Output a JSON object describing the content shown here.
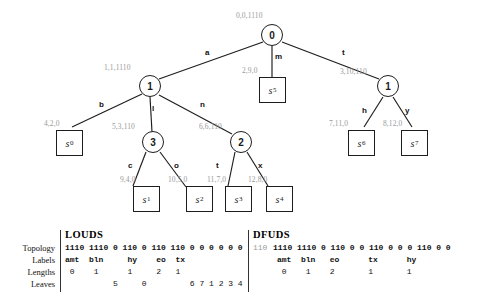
{
  "figure": {
    "type": "tree-diagram-with-bit-table",
    "tree": {
      "nodes": [
        {
          "id": "root",
          "label": "0",
          "annotation": "0,0,1110",
          "kind": "internal"
        },
        {
          "id": "n1",
          "label": "1",
          "annotation": "1,1,1110",
          "kind": "internal"
        },
        {
          "id": "n3",
          "label": "3",
          "annotation": "5,3,110",
          "kind": "internal"
        },
        {
          "id": "n2",
          "label": "2",
          "annotation": "6,6,110",
          "kind": "internal"
        },
        {
          "id": "nr1",
          "label": "1",
          "annotation": "3,10,110",
          "kind": "internal"
        }
      ],
      "leaves": [
        {
          "id": "s0",
          "label": "s",
          "sub": "0",
          "annotation": "4,2,0"
        },
        {
          "id": "s1",
          "label": "s",
          "sub": "1",
          "annotation": "9,4,0"
        },
        {
          "id": "s2",
          "label": "s",
          "sub": "2",
          "annotation": "10,5,0"
        },
        {
          "id": "s3",
          "label": "s",
          "sub": "3",
          "annotation": "11,7,0"
        },
        {
          "id": "s4",
          "label": "s",
          "sub": "4",
          "annotation": "12,8,0"
        },
        {
          "id": "s5",
          "label": "s",
          "sub": "5",
          "annotation": "2,9,0"
        },
        {
          "id": "s6",
          "label": "s",
          "sub": "6",
          "annotation": "7,11,0"
        },
        {
          "id": "s7",
          "label": "s",
          "sub": "7",
          "annotation": "8,12,0"
        }
      ],
      "edges": [
        {
          "from": "root",
          "to": "n1",
          "label": "a"
        },
        {
          "from": "root",
          "to": "s5",
          "label": "m"
        },
        {
          "from": "root",
          "to": "nr1",
          "label": "t"
        },
        {
          "from": "n1",
          "to": "s0",
          "label": "b"
        },
        {
          "from": "n1",
          "to": "n3",
          "label": "l"
        },
        {
          "from": "n1",
          "to": "n2",
          "label": "n"
        },
        {
          "from": "n3",
          "to": "s1",
          "label": "c"
        },
        {
          "from": "n3",
          "to": "s2",
          "label": "o"
        },
        {
          "from": "n2",
          "to": "s3",
          "label": "t"
        },
        {
          "from": "n2",
          "to": "s4",
          "label": "x"
        },
        {
          "from": "nr1",
          "to": "s6",
          "label": "h"
        },
        {
          "from": "nr1",
          "to": "s7",
          "label": "y"
        }
      ]
    },
    "table": {
      "row_labels": [
        "Topology",
        "Labels",
        "Lengths",
        "Leaves"
      ],
      "louds": {
        "heading": "LOUDS",
        "topology": "1110 1110 0 110 0 110 110 0 0 0 0 0 0",
        "labels": "amt  bln     hy    eo  tx",
        "lengths": " 0    1      1     2   1",
        "leaves": "          5     0         6 7 1 2 3 4"
      },
      "dfuds": {
        "heading": "DFUDS",
        "topology_prefix": "110",
        "topology": "1110 1110 0 110 0 0 110 0 0 0 110 0 0",
        "labels": "     amt  bln   eo      tx      hy",
        "lengths": "      0    1    2       1       1",
        "leaves": ""
      }
    }
  }
}
